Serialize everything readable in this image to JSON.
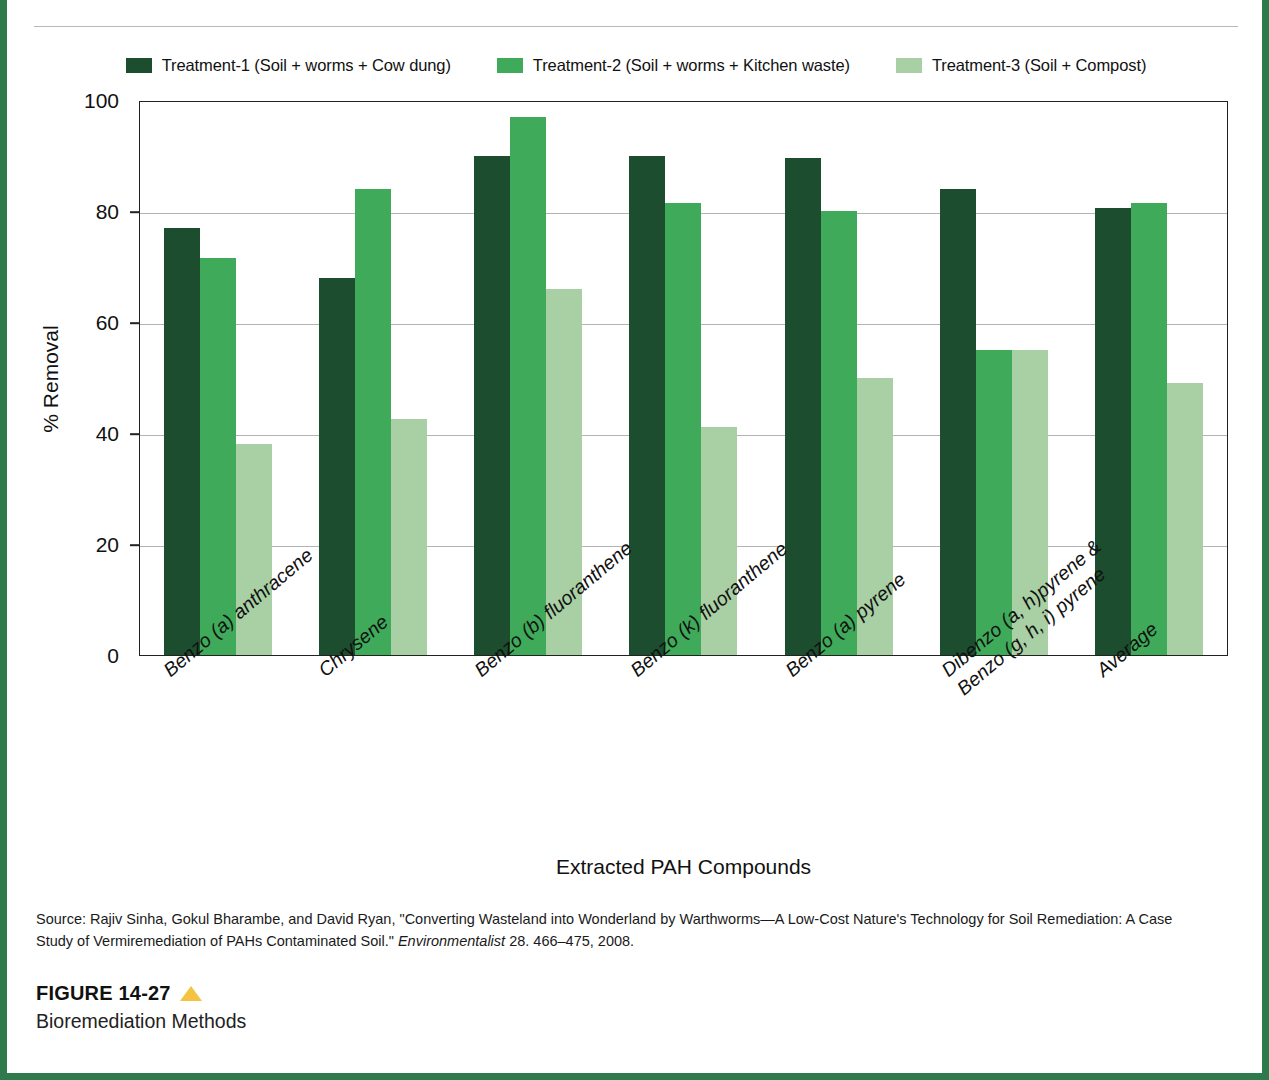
{
  "frame": {
    "border_color": "#2f7a4d",
    "top_cropped_text": ""
  },
  "legend": {
    "items": [
      {
        "label": "Treatment-1 (Soil + worms + Cow dung)",
        "color": "#1b4d2e",
        "swatch_name": "legend-swatch-treatment-1"
      },
      {
        "label": "Treatment-2 (Soil + worms + Kitchen waste)",
        "color": "#3faa5a",
        "swatch_name": "legend-swatch-treatment-2"
      },
      {
        "label": "Treatment-3 (Soil + Compost)",
        "color": "#a9cfa4",
        "swatch_name": "legend-swatch-treatment-3"
      }
    ]
  },
  "axes": {
    "y_title": "% Removal",
    "x_title": "Extracted PAH Compounds",
    "y_ticks": [
      "0",
      "20",
      "40",
      "60",
      "80",
      "100"
    ]
  },
  "source": {
    "line1_a": "Source: Rajiv Sinha, Gokul Bharambe, and David Ryan, \"Converting Wasteland into Wonderland by Warthworms",
    "line1_b": "A Low-Cost Nature's",
    "line2_a": "Technology for Soil Remediation: A Case Study of Vermiremediation of PAHs Contaminated Soil.\" ",
    "line2_italic": "Environmentalist",
    "line2_b": " 28. 466–475, 2008."
  },
  "figure": {
    "number": "FIGURE 14-27",
    "title": "Bioremediation Methods",
    "triangle_color": "#f5c342"
  },
  "chart_data": {
    "type": "bar",
    "title": "Bioremediation Methods",
    "xlabel": "Extracted PAH Compounds",
    "ylabel": "% Removal",
    "ylim": [
      0,
      100
    ],
    "yticks": [
      0,
      20,
      40,
      60,
      80,
      100
    ],
    "grid": true,
    "legend_position": "top-center",
    "categories": [
      "Benzo (a) anthracene",
      "Chrysene",
      "Benzo (b) fluoranthene",
      "Benzo (k) fluoranthene",
      "Benzo (a) pyrene",
      "Dibenzo (a, h)pyrene &\nBenzo (g, h, i) pyrene",
      "Average"
    ],
    "series": [
      {
        "name": "Treatment-1 (Soil + worms + Cow dung)",
        "color": "#1b4d2e",
        "values": [
          77,
          68,
          90,
          90,
          89.5,
          84,
          80.5
        ]
      },
      {
        "name": "Treatment-2 (Soil + worms + Kitchen waste)",
        "color": "#3faa5a",
        "values": [
          71.5,
          84,
          97,
          81.5,
          80,
          55,
          81.5
        ]
      },
      {
        "name": "Treatment-3 (Soil + Compost)",
        "color": "#a9cfa4",
        "values": [
          38,
          42.5,
          66,
          41,
          50,
          55,
          49
        ]
      }
    ]
  }
}
